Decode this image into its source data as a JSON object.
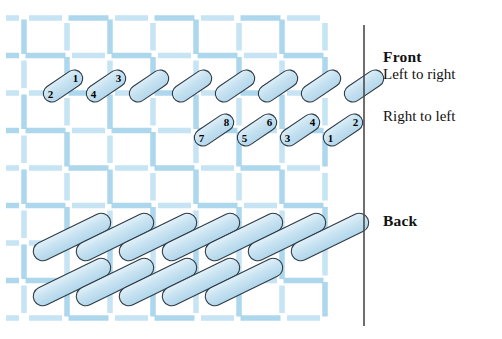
{
  "canvas": {
    "width": 502,
    "height": 339,
    "background": "#ffffff"
  },
  "colors": {
    "mesh_thread": "#a9d5ec",
    "mesh_thread_light": "#c3e3f4",
    "stitch_fill": "#c6e1f0",
    "stitch_fill_light": "#d8ecf7",
    "stitch_outline": "#2f3a44",
    "divider": "#4a4a4a",
    "text": "#111111"
  },
  "legend": {
    "front_title": "Front",
    "front_row1": "Left to right",
    "front_row2": "Right to left",
    "back_title": "Back"
  },
  "divider": {
    "x": 364,
    "y_top": 25,
    "y_bottom": 326,
    "width": 1.6
  },
  "mesh": {
    "x_start": 24,
    "x_end": 362,
    "y_start": 18,
    "y_end": 330,
    "col_spacing": 43,
    "row_spacing": 37.5,
    "thread_width": 5.5,
    "dash_gap": 6
  },
  "front": {
    "row_left_to_right": {
      "label": "Left to right",
      "count": 8,
      "numbered_stitches": [
        {
          "index": 0,
          "lower_number": "2",
          "upper_number": "1"
        },
        {
          "index": 1,
          "lower_number": "4",
          "upper_number": "3"
        }
      ]
    },
    "row_right_to_left": {
      "label": "Right to left",
      "count": 4,
      "numbered_stitches": [
        {
          "index": 0,
          "lower_number": "7",
          "upper_number": "8"
        },
        {
          "index": 1,
          "lower_number": "5",
          "upper_number": "6"
        },
        {
          "index": 2,
          "lower_number": "3",
          "upper_number": "4"
        },
        {
          "index": 3,
          "lower_number": "1",
          "upper_number": "2"
        }
      ]
    }
  },
  "back": {
    "label": "Back",
    "row_upper_count": 7,
    "row_lower_count": 5
  }
}
